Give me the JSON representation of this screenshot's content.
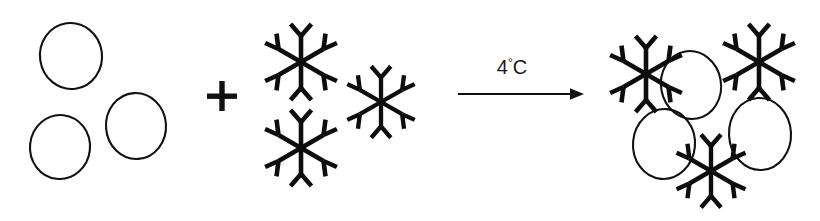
{
  "diagram": {
    "type": "reaction-schematic",
    "title": "",
    "background_color": "#ffffff",
    "stroke_color": "#111111",
    "flake_color": "#0d0d0d",
    "canvas": {
      "width": 820,
      "height": 221
    },
    "reaction": {
      "operator_symbol": "+",
      "arrow_symbol": "→",
      "condition_label": "4°C",
      "condition_value": "4",
      "condition_degree": "°",
      "condition_unit": "C"
    },
    "reactants": {
      "group_a": {
        "name": "circles",
        "icon": "circle-icon",
        "count": 3,
        "items": [
          {
            "cx": 71,
            "cy": 56,
            "rx": 31,
            "ry": 33,
            "rot": -8
          },
          {
            "cx": 60,
            "cy": 147,
            "rx": 30,
            "ry": 32,
            "rot": 6
          },
          {
            "cx": 136,
            "cy": 126,
            "rx": 30,
            "ry": 33,
            "rot": -4
          }
        ]
      },
      "group_b": {
        "name": "snowflakes",
        "icon": "snowflake-icon",
        "count": 3,
        "items": [
          {
            "cx": 301,
            "cy": 62,
            "scale": 1.0,
            "rot": 0
          },
          {
            "cx": 301,
            "cy": 148,
            "scale": 1.0,
            "rot": 0
          },
          {
            "cx": 381,
            "cy": 102,
            "scale": 0.94,
            "rot": 0
          }
        ]
      }
    },
    "products": {
      "name": "bound-complex",
      "circle_count": 3,
      "snowflake_count": 3,
      "circles": [
        {
          "cx": 691,
          "cy": 85,
          "rx": 30,
          "ry": 34,
          "rot": -10
        },
        {
          "cx": 664,
          "cy": 144,
          "rx": 31,
          "ry": 35,
          "rot": 5
        },
        {
          "cx": 760,
          "cy": 134,
          "rx": 31,
          "ry": 36,
          "rot": -3
        }
      ],
      "snowflakes": [
        {
          "cx": 646,
          "cy": 74,
          "scale": 1.0,
          "rot": 0
        },
        {
          "cx": 759,
          "cy": 62,
          "scale": 1.0,
          "rot": 0
        },
        {
          "cx": 711,
          "cy": 171,
          "scale": 0.96,
          "rot": 0
        }
      ]
    },
    "arrow": {
      "x1": 458,
      "x2": 584,
      "y": 94,
      "label_x": 512,
      "label_y": 68
    },
    "plus": {
      "cx": 222,
      "cy": 96,
      "arm": 15,
      "thickness": 5
    }
  }
}
